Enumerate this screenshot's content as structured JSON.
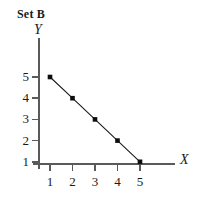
{
  "figure": {
    "title": "Set B",
    "background_color": "#ffffff",
    "ink_color": "#1a1a1a",
    "axis_color": "#5a5a5a"
  },
  "chart_data": {
    "type": "line",
    "title": "Set B",
    "xlabel": "X",
    "ylabel": "Y",
    "x": [
      1,
      2,
      3,
      4,
      5
    ],
    "values": [
      5,
      4,
      3,
      2,
      1
    ],
    "series": [
      {
        "name": "Set B",
        "x": [
          1,
          2,
          3,
          4,
          5
        ],
        "values": [
          5,
          4,
          3,
          2,
          1
        ],
        "marker": "filled-square",
        "color": "#0d0d0d"
      }
    ],
    "xlim": [
      0,
      5.6
    ],
    "ylim": [
      0,
      5.6
    ],
    "xticks": [
      1,
      2,
      3,
      4,
      5
    ],
    "yticks": [
      1,
      2,
      3,
      4,
      5
    ],
    "xtick_labels": [
      "1",
      "2",
      "3",
      "4",
      "5"
    ],
    "ytick_labels": [
      "1",
      "2",
      "3",
      "4",
      "5"
    ],
    "grid": false,
    "legend": false,
    "legend_position": "none"
  }
}
